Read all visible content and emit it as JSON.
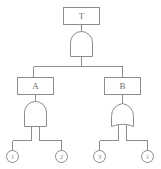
{
  "diagram": {
    "kind": "fault-tree",
    "title": "",
    "stroke_color": "#8c8c8c",
    "fill_color": "#ffffff",
    "text_color": "#6e6e6e",
    "top_event": {
      "id": "T",
      "label": "T",
      "shape": "rectangle"
    },
    "intermediate_events": [
      {
        "id": "A",
        "label": "A",
        "shape": "rectangle",
        "side": "left"
      },
      {
        "id": "B",
        "label": "B",
        "shape": "rectangle",
        "side": "right"
      }
    ],
    "gates": [
      {
        "id": "gate-top",
        "type": "AND",
        "symbol": "and-gate",
        "feeds": "T",
        "inputs": [
          "A",
          "B"
        ]
      },
      {
        "id": "gate-left",
        "type": "AND",
        "symbol": "and-gate",
        "feeds": "A",
        "inputs": [
          "e1",
          "e2"
        ]
      },
      {
        "id": "gate-right",
        "type": "OR",
        "symbol": "or-gate",
        "feeds": "B",
        "inputs": [
          "e3",
          "e4"
        ]
      }
    ],
    "basic_events": [
      {
        "id": "e1",
        "label": "1",
        "shape": "circle"
      },
      {
        "id": "e2",
        "label": "2",
        "shape": "circle"
      },
      {
        "id": "e3",
        "label": "3",
        "shape": "circle"
      },
      {
        "id": "e4",
        "label": "1",
        "shape": "circle"
      }
    ]
  }
}
